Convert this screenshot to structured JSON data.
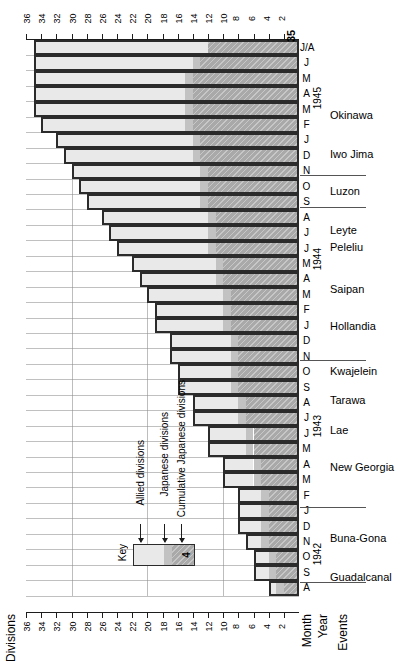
{
  "axis": {
    "title": "Divisions",
    "ticks": [
      36,
      34,
      32,
      30,
      28,
      26,
      24,
      22,
      20,
      18,
      16,
      14,
      12,
      10,
      8,
      6,
      4,
      2
    ],
    "max": 36
  },
  "footer": {
    "month_label": "Month",
    "year_label": "Year",
    "events_label": "Events"
  },
  "key": {
    "title": "Key",
    "items": [
      "Allied divisions",
      "Japanese divisions",
      "Cumulative Japanese divisions"
    ],
    "sample_value": "4"
  },
  "peak_label": "35",
  "years": [
    {
      "label": "1945",
      "pos": 0.11
    },
    {
      "label": "1944",
      "pos": 0.4
    },
    {
      "label": "1943",
      "pos": 0.7
    },
    {
      "label": "1942",
      "pos": 0.93
    }
  ],
  "events": [
    {
      "label": "Okinawa",
      "pos": 0.135
    },
    {
      "label": "Iwo Jima",
      "pos": 0.205
    },
    {
      "label": "Luzon",
      "pos": 0.272
    },
    {
      "label": "Leyte",
      "pos": 0.342
    },
    {
      "label": "Peleliu",
      "pos": 0.372
    },
    {
      "label": "Saipan",
      "pos": 0.448
    },
    {
      "label": "Hollandia",
      "pos": 0.515
    },
    {
      "label": "Kwajelein",
      "pos": 0.595
    },
    {
      "label": "Tarawa",
      "pos": 0.648
    },
    {
      "label": "Lae",
      "pos": 0.702
    },
    {
      "label": "New Georgia",
      "pos": 0.768
    },
    {
      "label": "Buna-Gona",
      "pos": 0.895
    },
    {
      "label": "Guadalcanal",
      "pos": 0.965
    }
  ],
  "chart_data": {
    "type": "bar",
    "xlabel": "Divisions",
    "ylabel": "Month / Year",
    "xlim": [
      0,
      36
    ],
    "grid": true,
    "orientation": "horizontal",
    "legend": [
      "Allied divisions",
      "Japanese divisions",
      "Cumulative Japanese divisions"
    ],
    "categories": [
      "J/A 1945",
      "J 1945",
      "M 1945",
      "A 1945",
      "M 1945",
      "F 1945",
      "J 1945",
      "D 1944",
      "N 1944",
      "O 1944",
      "S 1944",
      "A 1944",
      "J 1944",
      "J 1944",
      "M 1944",
      "A 1944",
      "M 1944",
      "F 1944",
      "J 1944",
      "D 1943",
      "N 1943",
      "O 1943",
      "S 1943",
      "A 1943",
      "J 1943",
      "J 1943",
      "M 1943",
      "A 1943",
      "M 1943",
      "F 1943",
      "J 1943",
      "D 1942",
      "N 1942",
      "O 1942",
      "S 1942",
      "A 1942"
    ],
    "series": [
      {
        "name": "Allied divisions",
        "values": [
          23,
          21,
          20,
          20,
          20,
          19,
          18,
          17,
          17,
          16,
          15,
          14,
          13,
          12,
          11,
          10,
          10,
          9,
          9,
          8,
          8,
          7,
          7,
          6,
          6,
          5,
          5,
          4,
          4,
          3,
          3,
          3,
          2,
          2,
          2,
          1
        ]
      },
      {
        "name": "Japanese divisions",
        "values": [
          0,
          1,
          1,
          1,
          1,
          1,
          1,
          1,
          1,
          1,
          1,
          1,
          1,
          1,
          1,
          1,
          1,
          1,
          1,
          1,
          1,
          1,
          1,
          1,
          1,
          1,
          1,
          1,
          1,
          1,
          1,
          1,
          1,
          1,
          1,
          1
        ]
      },
      {
        "name": "Cumulative Japanese divisions",
        "values": [
          12,
          13,
          14,
          14,
          14,
          14,
          13,
          13,
          12,
          12,
          12,
          11,
          11,
          11,
          10,
          10,
          9,
          9,
          9,
          8,
          8,
          8,
          8,
          7,
          7,
          6,
          6,
          5,
          5,
          4,
          4,
          4,
          4,
          3,
          3,
          2
        ]
      }
    ],
    "totals": [
      35,
      35,
      35,
      35,
      35,
      34,
      32,
      31,
      30,
      29,
      28,
      26,
      25,
      24,
      22,
      21,
      20,
      19,
      19,
      17,
      17,
      16,
      16,
      14,
      14,
      12,
      12,
      10,
      10,
      8,
      8,
      8,
      7,
      6,
      6,
      4
    ],
    "peak_total": 35
  }
}
